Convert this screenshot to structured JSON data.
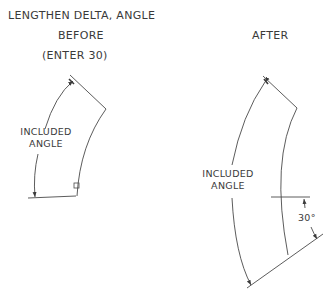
{
  "title": "LENGTHEN DELTA, ANGLE",
  "before": {
    "heading": "BEFORE",
    "instruction": "(ENTER 30)",
    "dimension_label_line1": "INCLUDED",
    "dimension_label_line2": "ANGLE"
  },
  "after": {
    "heading": "AFTER",
    "dimension_label_line1": "INCLUDED",
    "dimension_label_line2": "ANGLE",
    "delta_label": "30°"
  },
  "colors": {
    "line": "#4a4a4a",
    "text": "#3a3a3a",
    "background": "#ffffff"
  }
}
